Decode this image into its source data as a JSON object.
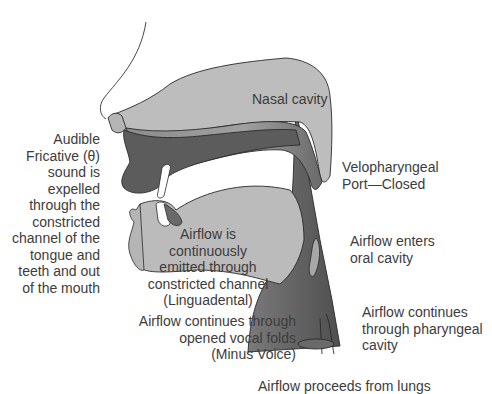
{
  "diagram": {
    "structures": [
      "Nasal cavity",
      "Oral cavity",
      "Pharyngeal cavity",
      "Velum",
      "Tongue",
      "Teeth",
      "Lips",
      "Vocal folds",
      "Trachea"
    ],
    "labels": {
      "nasal_cavity": "Nasal cavity",
      "audible_fricative": "Audible\nFricative (θ)\nsound is\nexpelled\nthrough the\nconstricted\nchannel of the\ntongue and\nteeth and out\nof the mouth",
      "velopharyngeal": "Velopharyngeal\nPort—Closed",
      "airflow_continuous": "Airflow is\ncontinuously\nemitted through\nconstricted channel\n(Linguadental)",
      "airflow_enters": "Airflow enters\noral cavity",
      "airflow_pharyngeal": "Airflow continues\nthrough pharyngeal\ncavity",
      "airflow_vocal_folds": "Airflow continues through\nopened vocal folds\n(Minus Voice)",
      "airflow_lungs": "Airflow proceeds from lungs"
    },
    "colors": {
      "light_tissue": "#b9b9b9",
      "mid_tissue": "#8a8a8a",
      "dark_tissue": "#5e5e5e",
      "outline": "#2a2a2a",
      "text": "#3c3c3c"
    }
  }
}
